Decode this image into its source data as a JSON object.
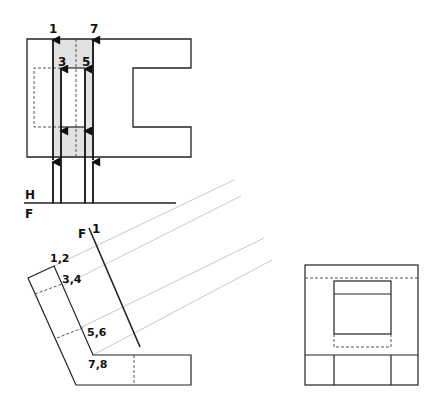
{
  "diagram": {
    "type": "orthographic-auxiliary-view",
    "colors": {
      "line": "#222222",
      "construction": "#c8c8c8",
      "shade": "#e2e2e2",
      "hidden": "#333333"
    },
    "top_view": {
      "point_labels": {
        "p1": "1",
        "p7": "7",
        "p3": "3",
        "p5": "5"
      }
    },
    "fold_line_hf": {
      "upper_label": "H",
      "lower_label": "F"
    },
    "front_view": {
      "fold_line_label_f": "F",
      "fold_line_label_1": "1",
      "point_labels": {
        "p12": "1,2",
        "p34": "3,4",
        "p56": "5,6",
        "p78": "7,8"
      }
    },
    "side_view": {}
  }
}
